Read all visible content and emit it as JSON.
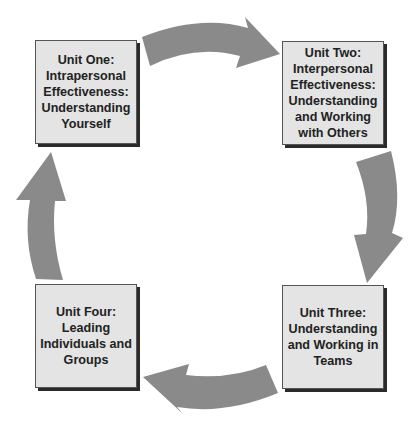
{
  "diagram": {
    "type": "cycle",
    "colors": {
      "box_fill": "#e4e4e4",
      "box_border": "#555555",
      "arrow": "#8a8a8a",
      "text": "#222222"
    },
    "units": [
      {
        "id": "unit-one",
        "label": "Unit One: Intrapersonal Effectiveness: Understanding Yourself"
      },
      {
        "id": "unit-two",
        "label": "Unit Two: Interpersonal Effectiveness: Understanding and Working with Others"
      },
      {
        "id": "unit-three",
        "label": "Unit Three: Understanding and Working in Teams"
      },
      {
        "id": "unit-four",
        "label": "Unit Four: Leading Individuals and Groups"
      }
    ],
    "arrows": [
      {
        "from": "unit-one",
        "to": "unit-two",
        "direction": "right"
      },
      {
        "from": "unit-two",
        "to": "unit-three",
        "direction": "down"
      },
      {
        "from": "unit-three",
        "to": "unit-four",
        "direction": "left"
      },
      {
        "from": "unit-four",
        "to": "unit-one",
        "direction": "up"
      }
    ]
  }
}
